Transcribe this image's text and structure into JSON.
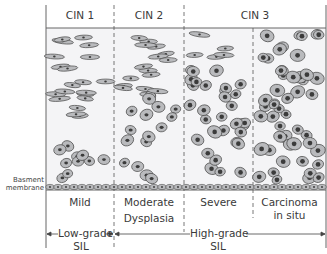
{
  "header": {
    "stages": [
      {
        "label": "CIN 1"
      },
      {
        "label": "CIN 2"
      },
      {
        "label": "CIN 3"
      }
    ]
  },
  "side_label": {
    "line1": "Basment",
    "line2": "membrane"
  },
  "grades": [
    {
      "label_line1": "Mild",
      "label_line2": ""
    },
    {
      "label_line1": "Moderate",
      "label_line2": "Dysplasia"
    },
    {
      "label_line1": "Severe",
      "label_line2": ""
    },
    {
      "label_line1": "Carcinoma",
      "label_line2": "in situ"
    }
  ],
  "sil": {
    "low": {
      "line1": "Low-grade",
      "line2": "SIL"
    },
    "high": {
      "line1": "High-grade",
      "line2": "SIL"
    }
  },
  "colors": {
    "background": "#f4f4f6",
    "cell_fill": "#b9babd",
    "cell_stroke": "#4a4a4a",
    "nucleus": "#3b3b3b",
    "divider": "#555555"
  }
}
